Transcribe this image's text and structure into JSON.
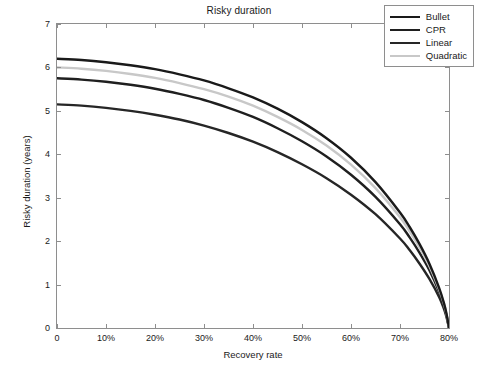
{
  "chart_data": {
    "type": "line",
    "title": "Risky duration",
    "xlabel": "Recovery rate",
    "ylabel": "Risky duration (years)",
    "xlim": [
      0,
      80
    ],
    "ylim": [
      0,
      7
    ],
    "grid": false,
    "legend_position": "top-right",
    "x_ticks": [
      0,
      10,
      20,
      30,
      40,
      50,
      60,
      70,
      80
    ],
    "x_tick_labels": [
      "0",
      "10%",
      "20%",
      "30%",
      "40%",
      "50%",
      "60%",
      "70%",
      "80%"
    ],
    "y_ticks": [
      0,
      1,
      2,
      3,
      4,
      5,
      6,
      7
    ],
    "y_tick_labels": [
      "0",
      "1",
      "2",
      "3",
      "4",
      "5",
      "6",
      "7"
    ],
    "x": [
      0,
      5,
      10,
      15,
      20,
      25,
      30,
      35,
      40,
      45,
      50,
      55,
      60,
      65,
      70,
      72,
      74,
      76,
      78,
      79,
      79.5,
      80
    ],
    "series": [
      {
        "name": "Bullet",
        "color": "#1a1a1a",
        "values": [
          6.2,
          6.17,
          6.12,
          6.05,
          5.96,
          5.84,
          5.7,
          5.52,
          5.31,
          5.05,
          4.74,
          4.37,
          3.92,
          3.36,
          2.66,
          2.32,
          1.93,
          1.48,
          0.92,
          0.56,
          0.32,
          0.0
        ]
      },
      {
        "name": "CPR",
        "color": "#1f1f1f",
        "values": [
          5.75,
          5.72,
          5.67,
          5.6,
          5.51,
          5.39,
          5.25,
          5.07,
          4.86,
          4.6,
          4.3,
          3.95,
          3.53,
          3.02,
          2.39,
          2.08,
          1.73,
          1.33,
          0.83,
          0.5,
          0.29,
          0.0
        ]
      },
      {
        "name": "Linear",
        "color": "#262626",
        "values": [
          5.15,
          5.12,
          5.07,
          5.0,
          4.91,
          4.8,
          4.66,
          4.49,
          4.29,
          4.05,
          3.77,
          3.45,
          3.07,
          2.62,
          2.06,
          1.79,
          1.48,
          1.13,
          0.71,
          0.43,
          0.25,
          0.0
        ]
      },
      {
        "name": "Quadratic",
        "color": "#c8c8c8",
        "values": [
          6.0,
          5.97,
          5.92,
          5.85,
          5.76,
          5.64,
          5.5,
          5.33,
          5.12,
          4.86,
          4.56,
          4.2,
          3.76,
          3.22,
          2.55,
          2.22,
          1.85,
          1.42,
          0.88,
          0.54,
          0.31,
          0.0
        ]
      }
    ]
  },
  "legend": {
    "items": [
      {
        "label": "Bullet"
      },
      {
        "label": "CPR"
      },
      {
        "label": "Linear"
      },
      {
        "label": "Quadratic"
      }
    ]
  },
  "caption": {
    "text": ""
  }
}
